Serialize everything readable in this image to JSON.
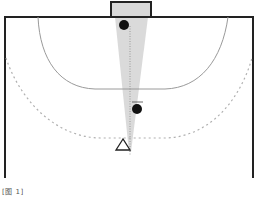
{
  "figure": {
    "caption": "[图 1]",
    "colors": {
      "court_line": "#222222",
      "arc_line": "#9a9a9a",
      "dashed_arc": "#b0b0b0",
      "shaded_zone": "#d4d4d4",
      "goal_fill": "#d8d8d8",
      "player_dot": "#111111"
    },
    "elements": {
      "goal": {
        "label": "goal"
      },
      "goal_area_line": {
        "label": "6m line"
      },
      "free_throw_line": {
        "label": "9m dashed line"
      },
      "goalkeeper": {
        "label": "goalkeeper"
      },
      "defender": {
        "label": "defender"
      },
      "attacker": {
        "label": "attacker (triangle)"
      },
      "shot_cone": {
        "label": "shooting angle"
      }
    }
  }
}
